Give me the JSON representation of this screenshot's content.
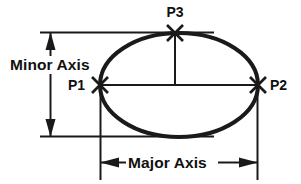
{
  "diagram": {
    "shape": "ellipse",
    "stroke_color": "#1a1a1a",
    "background_color": "#ffffff",
    "labels": {
      "minor_axis": "Minor Axis",
      "major_axis": "Major Axis",
      "p1": "P1",
      "p2": "P2",
      "p3": "P3"
    },
    "points": [
      {
        "id": "p1",
        "label": "P1",
        "marker": "x-cross",
        "x": 100,
        "y": 85,
        "description": "left end of major axis"
      },
      {
        "id": "p2",
        "label": "P2",
        "marker": "x-cross",
        "x": 258,
        "y": 85,
        "description": "right end of major axis"
      },
      {
        "id": "p3",
        "label": "P3",
        "marker": "x-cross",
        "x": 175,
        "y": 33,
        "description": "top of minor axis"
      }
    ],
    "dimensions": [
      {
        "id": "minor-axis",
        "label": "Minor Axis",
        "orientation": "vertical",
        "arrowheads": "both"
      },
      {
        "id": "major-axis",
        "label": "Major Axis",
        "orientation": "horizontal",
        "arrowheads": "both"
      }
    ]
  }
}
